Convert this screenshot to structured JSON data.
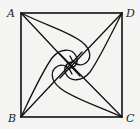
{
  "diagram": {
    "labels": {
      "A": "A",
      "B": "B",
      "C": "C",
      "D": "D"
    },
    "vertices": {
      "A": [
        21,
        13
      ],
      "D": [
        122,
        13
      ],
      "B": [
        21,
        117
      ],
      "C": [
        122,
        117
      ]
    },
    "colors": {
      "background": "#f4f4f2",
      "stroke": "#111111",
      "label": "#222222"
    }
  }
}
